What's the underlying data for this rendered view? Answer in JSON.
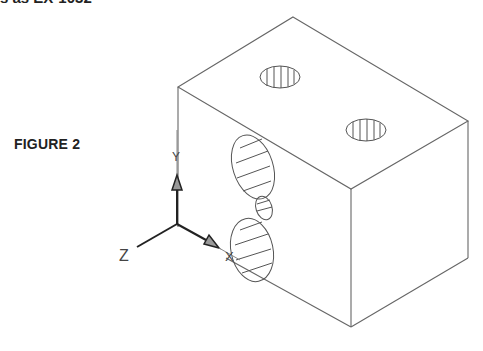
{
  "header": {
    "cropped_text": "s as EX-1032"
  },
  "figure": {
    "label": "FIGURE 2"
  },
  "ucs_icon": {
    "x_label": "X",
    "y_label": "Y",
    "z_label": "Z"
  },
  "colors": {
    "line": "#555555",
    "axis": "#222222",
    "background": "#ffffff"
  }
}
